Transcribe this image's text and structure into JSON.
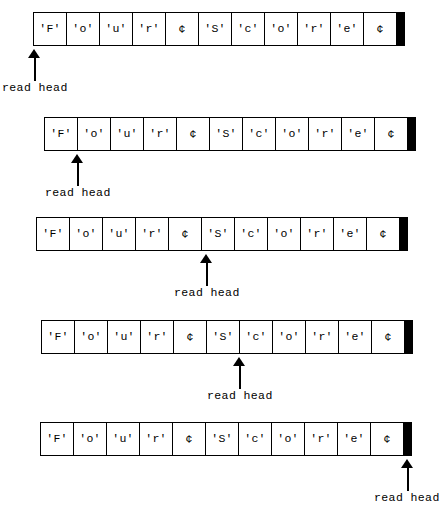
{
  "figure": {
    "cell_count": 11,
    "tape_symbols": [
      "'F'",
      "'o'",
      "'u'",
      "'r'",
      "¢",
      "'S'",
      "'c'",
      "'o'",
      "'r'",
      "'e'",
      "¢"
    ],
    "end_marker": "black-terminator-bar",
    "ink_color": "#000000",
    "paper_color": "#ffffff"
  },
  "steps": [
    {
      "index": 1,
      "label": "read head",
      "cells": [
        "'F'",
        "'o'",
        "'u'",
        "'r'",
        "¢",
        "'S'",
        "'c'",
        "'o'",
        "'r'",
        "'e'",
        "¢"
      ],
      "head_position_index": 0,
      "head_target_symbol": "'F'"
    },
    {
      "index": 2,
      "label": "read head",
      "cells": [
        "'F'",
        "'o'",
        "'u'",
        "'r'",
        "¢",
        "'S'",
        "'c'",
        "'o'",
        "'r'",
        "'e'",
        "¢"
      ],
      "head_position_index": 1,
      "head_target_symbol": "'o'"
    },
    {
      "index": 3,
      "label": "read head",
      "cells": [
        "'F'",
        "'o'",
        "'u'",
        "'r'",
        "¢",
        "'S'",
        "'c'",
        "'o'",
        "'r'",
        "'e'",
        "¢"
      ],
      "head_position_index": 5,
      "head_target_symbol": "'S'"
    },
    {
      "index": 4,
      "label": "read head",
      "cells": [
        "'F'",
        "'o'",
        "'u'",
        "'r'",
        "¢",
        "'S'",
        "'c'",
        "'o'",
        "'r'",
        "'e'",
        "¢"
      ],
      "head_position_index": 6,
      "head_target_symbol": "'c'"
    },
    {
      "index": 5,
      "label": "read head",
      "cells": [
        "'F'",
        "'o'",
        "'u'",
        "'r'",
        "¢",
        "'S'",
        "'c'",
        "'o'",
        "'r'",
        "'e'",
        "¢"
      ],
      "head_position_index": 11,
      "head_target_symbol": "¢"
    }
  ]
}
